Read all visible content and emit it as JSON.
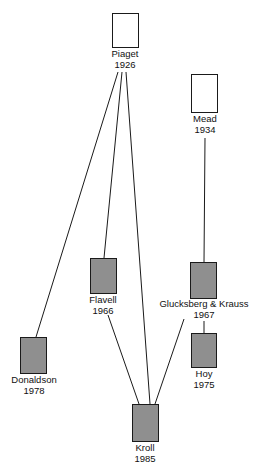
{
  "diagram": {
    "type": "influence-tree",
    "colors": {
      "empty_box": "#ffffff",
      "filled_box": "#8f8f8f",
      "line": "#1a1a1a"
    },
    "nodes": [
      {
        "id": "piaget",
        "name": "Piaget",
        "year": "1926",
        "style": "empty"
      },
      {
        "id": "mead",
        "name": "Mead",
        "year": "1934",
        "style": "empty"
      },
      {
        "id": "flavell",
        "name": "Flavell",
        "year": "1966",
        "style": "filled"
      },
      {
        "id": "glucksberg",
        "name": "Glucksberg & Krauss",
        "year": "1967",
        "style": "filled"
      },
      {
        "id": "hoy",
        "name": "Hoy",
        "year": "1975",
        "style": "filled"
      },
      {
        "id": "donaldson",
        "name": "Donaldson",
        "year": "1978",
        "style": "filled"
      },
      {
        "id": "kroll",
        "name": "Kroll",
        "year": "1985",
        "style": "filled"
      }
    ],
    "edges": [
      [
        "piaget",
        "donaldson"
      ],
      [
        "piaget",
        "flavell"
      ],
      [
        "piaget",
        "kroll"
      ],
      [
        "flavell",
        "kroll"
      ],
      [
        "mead",
        "glucksberg"
      ],
      [
        "glucksberg",
        "hoy"
      ],
      [
        "glucksberg",
        "kroll"
      ]
    ]
  }
}
